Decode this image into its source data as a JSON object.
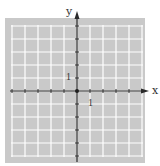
{
  "chart_data": {
    "type": "scatter",
    "title": "",
    "xlabel": "x",
    "ylabel": "y",
    "xlim": [
      -5,
      5
    ],
    "ylim": [
      -5,
      5
    ],
    "grid": true,
    "x_tick_step": 1,
    "y_tick_step": 1,
    "labeled_ticks": {
      "x": [
        "1"
      ],
      "y": [
        "1"
      ]
    },
    "series": [],
    "annotations": [],
    "legend": null
  },
  "labels": {
    "x_axis": "x",
    "y_axis": "y",
    "x_unit": "1",
    "y_unit": "1"
  },
  "colors": {
    "panel": "#c9c9c9",
    "grid": "#ffffff",
    "axis": "#2b2b2b",
    "background": "#ffffff"
  }
}
